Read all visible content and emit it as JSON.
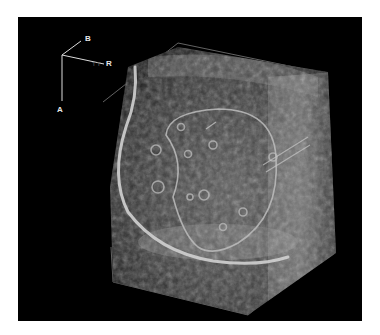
{
  "image": {
    "description": "3D ultrasound volume rendering of a cube-shaped tissue block with traced contour lines",
    "background": "#000000",
    "frame_color": "#ffffff"
  },
  "orientation_axes": {
    "labels": {
      "a": "A",
      "b": "B",
      "r": "R"
    },
    "faint_prefix": "T T",
    "color": "#dcdcdc"
  },
  "overlays": {
    "outer_contour_color": "#cfcfcf",
    "inner_contour_color": "#bdbdbd",
    "bounding_box_color": "#9a9a9a"
  }
}
